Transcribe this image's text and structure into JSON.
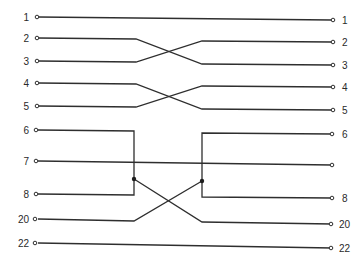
{
  "diagram": {
    "type": "cable-pinout-wiring",
    "left_pins": [
      {
        "label": "1",
        "y": 17
      },
      {
        "label": "2",
        "y": 38
      },
      {
        "label": "3",
        "y": 61
      },
      {
        "label": "4",
        "y": 83
      },
      {
        "label": "5",
        "y": 106
      },
      {
        "label": "6",
        "y": 130
      },
      {
        "label": "7",
        "y": 161
      },
      {
        "label": "8",
        "y": 194
      },
      {
        "label": "20",
        "y": 219
      },
      {
        "label": "22",
        "y": 243
      }
    ],
    "right_pins": [
      {
        "label": "1",
        "y": 20
      },
      {
        "label": "2",
        "y": 42
      },
      {
        "label": "3",
        "y": 65
      },
      {
        "label": "4",
        "y": 87
      },
      {
        "label": "5",
        "y": 110
      },
      {
        "label": "6",
        "y": 134
      },
      {
        "label": "",
        "y": 165
      },
      {
        "label": "8",
        "y": 198
      },
      {
        "label": "20",
        "y": 224
      },
      {
        "label": "22",
        "y": 248
      }
    ],
    "connections": [
      {
        "from": "1",
        "to": "1",
        "kind": "straight"
      },
      {
        "from": "2",
        "to": "3",
        "kind": "crossed"
      },
      {
        "from": "3",
        "to": "2",
        "kind": "crossed"
      },
      {
        "from": "4",
        "to": "5",
        "kind": "crossed"
      },
      {
        "from": "5",
        "to": "4",
        "kind": "crossed"
      },
      {
        "from": "6+8",
        "to": "20",
        "kind": "jumpered-crossed"
      },
      {
        "from": "7",
        "to": "7",
        "kind": "straight"
      },
      {
        "from": "20",
        "to": "6+8",
        "kind": "jumpered-crossed"
      },
      {
        "from": "22",
        "to": "22",
        "kind": "straight"
      }
    ],
    "colors": {
      "line": "#2e2e2e",
      "background": "#ffffff"
    }
  }
}
